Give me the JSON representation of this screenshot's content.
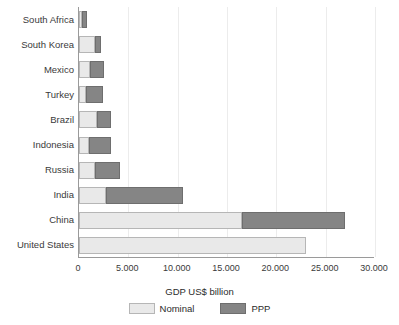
{
  "chart_data": {
    "type": "bar",
    "orientation": "horizontal",
    "stacked": true,
    "title": "",
    "xlabel": "GDP US$ billion",
    "ylabel": "",
    "xlim": [
      0,
      30000
    ],
    "ylim": null,
    "grid": true,
    "grid_axis": "x",
    "legend_position": "bottom",
    "categories": [
      "South Africa",
      "South Korea",
      "Mexico",
      "Turkey",
      "Brazil",
      "Indonesia",
      "Russia",
      "India",
      "China",
      "United States"
    ],
    "series": [
      {
        "name": "Nominal",
        "color": "#e9e9e9",
        "values": [
          350,
          1600,
          1150,
          750,
          1850,
          1020,
          1600,
          2700,
          16500,
          23000
        ]
      },
      {
        "name": "PPP",
        "color": "#858585",
        "values": [
          450,
          650,
          1400,
          1650,
          1350,
          2200,
          2550,
          7800,
          10500,
          0
        ]
      }
    ],
    "totals": [
      800,
      2250,
      2550,
      2400,
      3200,
      3220,
      4150,
      10500,
      27000,
      23000
    ],
    "xticks": [
      0,
      5000,
      10000,
      15000,
      20000,
      25000,
      30000
    ],
    "xtick_labels": [
      "0",
      "5.000",
      "10.000",
      "15.000",
      "20.000",
      "25.000",
      "30.000"
    ],
    "legend_entries": [
      {
        "label": "Nominal",
        "color": "#e9e9e9"
      },
      {
        "label": "PPP",
        "color": "#858585"
      }
    ]
  },
  "axis": {
    "title": "GDP US$ billion"
  },
  "colors": {
    "nominal": "#e9e9e9",
    "ppp": "#858585",
    "axis_line": "#9a9a9a",
    "gridline": "#ececec",
    "text": "#2b2b2b",
    "background": "#ffffff"
  }
}
